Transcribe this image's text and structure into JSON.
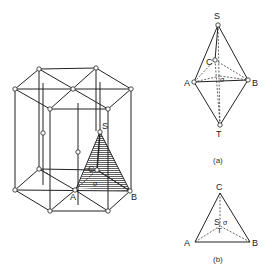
{
  "figure": {
    "prism": {
      "labels": {
        "S": "S",
        "C": "C",
        "A": "A",
        "B": "B",
        "sigma": "σ"
      }
    },
    "panel_a": {
      "caption": "(a)",
      "labels": {
        "S": "S",
        "C": "C",
        "A": "A",
        "B": "B",
        "T": "T",
        "sigma": "σ"
      }
    },
    "panel_b": {
      "caption": "(b)",
      "labels": {
        "C": "C",
        "A": "A",
        "B": "B",
        "S": "S",
        "T": "T",
        "sigma": "σ"
      }
    }
  }
}
